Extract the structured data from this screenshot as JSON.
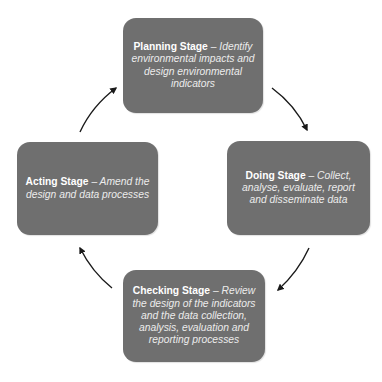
{
  "diagram": {
    "type": "cycle",
    "colors": {
      "box_fill": "#6f6f6f",
      "text": "#ffffff",
      "arrow": "#1a1a1a",
      "background": "#ffffff"
    },
    "stages": [
      {
        "id": "planning",
        "name": "Planning Stage",
        "separator": " – ",
        "description": "Identify environmental impacts and design environmental indicators"
      },
      {
        "id": "doing",
        "name": "Doing Stage",
        "separator": " – ",
        "description": "Collect, analyse, evaluate, report and disseminate data"
      },
      {
        "id": "checking",
        "name": "Checking Stage",
        "separator": " – ",
        "description": "Review the design of the indicators and the data collection, analysis, evaluation and reporting processes"
      },
      {
        "id": "acting",
        "name": "Acting Stage",
        "separator": " – ",
        "description": "Amend the design and data processes"
      }
    ],
    "arrows": [
      {
        "from": "planning",
        "to": "doing",
        "icon": "arrow-clockwise-icon"
      },
      {
        "from": "doing",
        "to": "checking",
        "icon": "arrow-clockwise-icon"
      },
      {
        "from": "checking",
        "to": "acting",
        "icon": "arrow-clockwise-icon"
      },
      {
        "from": "acting",
        "to": "planning",
        "icon": "arrow-clockwise-icon"
      }
    ]
  }
}
